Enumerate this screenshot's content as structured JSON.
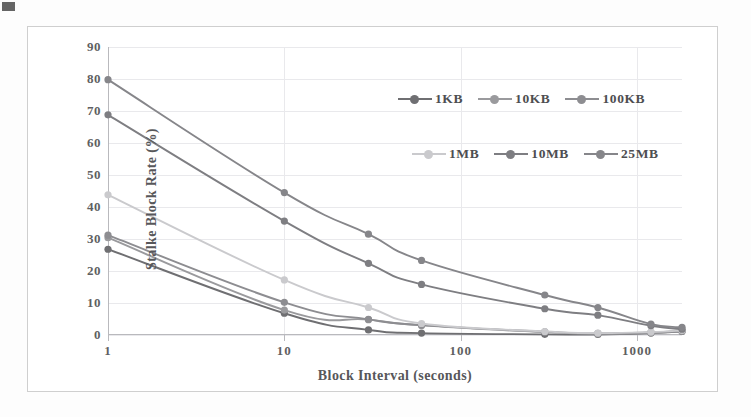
{
  "figure": {
    "background": "#ffffff",
    "border_color": "#cfcfcf"
  },
  "chart_data": {
    "type": "line",
    "title": "",
    "xlabel": "Block Interval (seconds)",
    "ylabel": "Stalke Block Rate (%)",
    "xscale": "log",
    "xlim": [
      1,
      1800
    ],
    "ylim": [
      0,
      90
    ],
    "grid": true,
    "legend_position": "upper-right-inside",
    "xticks": [
      "1",
      "10",
      "100",
      "1000"
    ],
    "xtick_values": [
      1,
      10,
      100,
      1000
    ],
    "yticks": [
      "0",
      "10",
      "20",
      "30",
      "40",
      "50",
      "60",
      "70",
      "80",
      "90"
    ],
    "ytick_values": [
      0,
      10,
      20,
      30,
      40,
      50,
      60,
      70,
      80,
      90
    ],
    "x": [
      1,
      10,
      30,
      60,
      300,
      600,
      1200,
      1800
    ],
    "series": [
      {
        "name": "1KB",
        "color": "#6f6f72",
        "marker": "circle",
        "values": [
          26.8,
          6.8,
          1.6,
          0.6,
          0.2,
          0.15,
          0.6,
          1.1
        ]
      },
      {
        "name": "10KB",
        "color": "#9a9a9d",
        "marker": "circle",
        "values": [
          30.4,
          7.8,
          4.8,
          3.0,
          0.9,
          0.4,
          0.7,
          1.2
        ]
      },
      {
        "name": "100KB",
        "color": "#8d8d91",
        "marker": "circle",
        "values": [
          31.2,
          10.2,
          4.9,
          3.1,
          1.0,
          0.5,
          0.8,
          1.3
        ]
      },
      {
        "name": "1MB",
        "color": "#cacacd",
        "marker": "circle",
        "values": [
          43.8,
          17.2,
          8.6,
          3.6,
          1.1,
          0.6,
          0.9,
          1.4
        ]
      },
      {
        "name": "10MB",
        "color": "#7e7e82",
        "marker": "circle",
        "values": [
          68.8,
          35.6,
          22.4,
          15.8,
          8.2,
          6.2,
          2.9,
          1.8
        ]
      },
      {
        "name": "25MB",
        "color": "#86868a",
        "marker": "circle",
        "values": [
          79.8,
          44.5,
          31.5,
          23.3,
          12.5,
          8.6,
          3.4,
          2.4
        ]
      }
    ]
  }
}
